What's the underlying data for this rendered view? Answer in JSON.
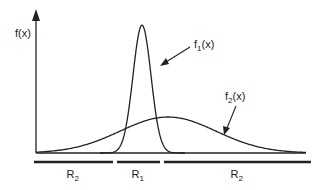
{
  "figure": {
    "y_axis_label": "f(x)",
    "curves": [
      {
        "name": "f1",
        "label_main": "f",
        "label_sub": "1",
        "label_tail": "(x)",
        "peak_x": 142,
        "peak_y": 25,
        "sigma": 9
      },
      {
        "name": "f2",
        "label_main": "f",
        "label_sub": "2",
        "label_tail": "(x)",
        "peak_x": 168,
        "peak_y": 117,
        "sigma": 48
      }
    ],
    "regions": [
      {
        "label_main": "R",
        "label_sub": "2",
        "x1": 34,
        "x2": 113
      },
      {
        "label_main": "R",
        "label_sub": "1",
        "x1": 117,
        "x2": 160
      },
      {
        "label_main": "R",
        "label_sub": "2",
        "x1": 164,
        "x2": 311
      }
    ],
    "colors": {
      "line": "#222222",
      "background": "#ffffff"
    }
  }
}
